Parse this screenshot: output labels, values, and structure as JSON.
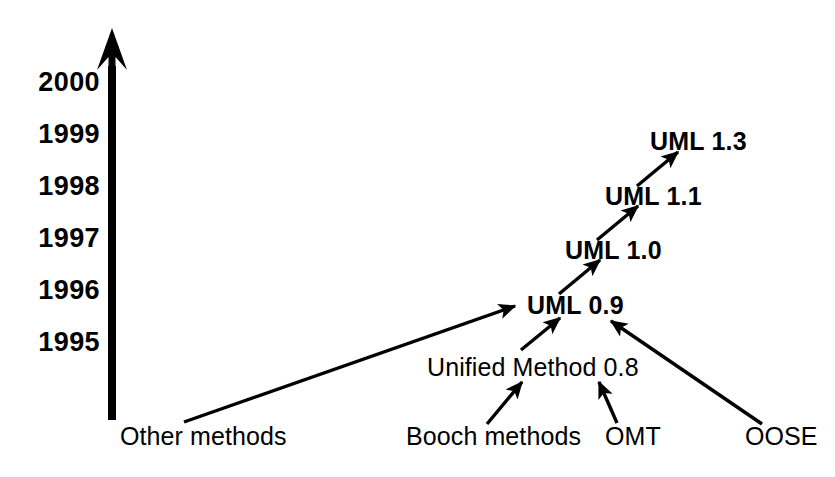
{
  "diagram": {
    "kind": "timeline-genealogy",
    "background_color": "#ffffff",
    "ink_color": "#000000"
  },
  "axis": {
    "name": "time-axis",
    "orientation": "vertical",
    "direction": "upward",
    "x": 112,
    "top_y": 28,
    "bottom_y": 420,
    "shaft_width": 8,
    "years": [
      {
        "label": "2000",
        "y": 82
      },
      {
        "label": "1999",
        "y": 134
      },
      {
        "label": "1998",
        "y": 186
      },
      {
        "label": "1997",
        "y": 238
      },
      {
        "label": "1996",
        "y": 290
      },
      {
        "label": "1995",
        "y": 342
      }
    ],
    "year_label_right_x": 100
  },
  "nodes": [
    {
      "id": "uml13",
      "label": "UML 1.3",
      "style": "version",
      "x": 650,
      "y": 141
    },
    {
      "id": "uml11",
      "label": "UML 1.1",
      "style": "version",
      "x": 605,
      "y": 196
    },
    {
      "id": "uml10",
      "label": "UML 1.0",
      "style": "version",
      "x": 565,
      "y": 250
    },
    {
      "id": "uml09",
      "label": "UML 0.9",
      "style": "version",
      "x": 527,
      "y": 305
    },
    {
      "id": "unified",
      "label": "Unified Method 0.8",
      "style": "method",
      "x": 427,
      "y": 367
    },
    {
      "id": "other",
      "label": "Other methods",
      "style": "method",
      "x": 120,
      "y": 436
    },
    {
      "id": "booch",
      "label": "Booch methods",
      "style": "method",
      "x": 406,
      "y": 436
    },
    {
      "id": "omt",
      "label": "OMT",
      "style": "method",
      "x": 605,
      "y": 436
    },
    {
      "id": "oose",
      "label": "OOSE",
      "style": "method",
      "x": 745,
      "y": 436
    }
  ],
  "edges": [
    {
      "from": "uml11",
      "to": "uml13",
      "x1": 637,
      "y1": 186,
      "x2": 678,
      "y2": 152
    },
    {
      "from": "uml10",
      "to": "uml11",
      "x1": 597,
      "y1": 240,
      "x2": 638,
      "y2": 206
    },
    {
      "from": "uml09",
      "to": "uml10",
      "x1": 559,
      "y1": 294,
      "x2": 600,
      "y2": 260
    },
    {
      "from": "unified",
      "to": "uml09",
      "x1": 521,
      "y1": 350,
      "x2": 560,
      "y2": 318
    },
    {
      "from": "booch",
      "to": "unified",
      "x1": 487,
      "y1": 424,
      "x2": 522,
      "y2": 382
    },
    {
      "from": "omt",
      "to": "unified",
      "x1": 617,
      "y1": 423,
      "x2": 599,
      "y2": 382
    },
    {
      "from": "oose",
      "to": "uml09",
      "x1": 762,
      "y1": 424,
      "x2": 611,
      "y2": 321
    },
    {
      "from": "other",
      "to": "uml09",
      "x1": 184,
      "y1": 422,
      "x2": 515,
      "y2": 306
    }
  ]
}
